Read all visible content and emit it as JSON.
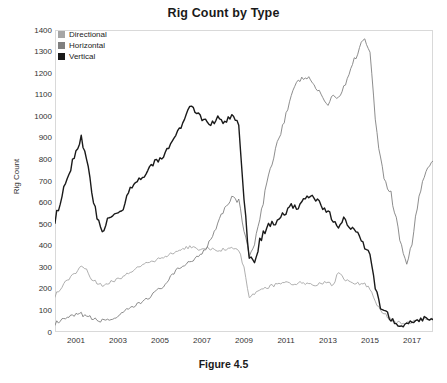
{
  "figure": {
    "title": "Rig Count by Type",
    "caption": "Figure 4.5"
  },
  "legend": {
    "position": "top-left-inside",
    "items": [
      {
        "label": "Directional",
        "color": "#a6a6a6",
        "swatch_name": "legend-swatch-directional"
      },
      {
        "label": "Horizontal",
        "color": "#808080",
        "swatch_name": "legend-swatch-horizontal"
      },
      {
        "label": "Vertical",
        "color": "#1a1a1a",
        "swatch_name": "legend-swatch-vertical"
      }
    ]
  },
  "axes": {
    "y_title": "Rig Count",
    "y_ticks": [
      "0",
      "100",
      "200",
      "300",
      "400",
      "500",
      "600",
      "700",
      "800",
      "900",
      "1000",
      "1100",
      "1200",
      "1300",
      "1400"
    ],
    "x_ticks": [
      "2001",
      "2003",
      "2005",
      "2007",
      "2009",
      "2011",
      "2013",
      "2015",
      "2017"
    ]
  },
  "chart_data": {
    "type": "line",
    "title": "Rig Count by Type",
    "subtitle": "Figure 4.5",
    "xlabel": "",
    "ylabel": "Rig Count",
    "xlim": [
      2000.0,
      2018.0
    ],
    "ylim": [
      0,
      1400
    ],
    "y_ticks": [
      0,
      100,
      200,
      300,
      400,
      500,
      600,
      700,
      800,
      900,
      1000,
      1100,
      1200,
      1300,
      1400
    ],
    "x_ticks": [
      2001,
      2003,
      2005,
      2007,
      2009,
      2011,
      2013,
      2015,
      2017
    ],
    "grid": false,
    "legend_position": "upper left",
    "x_unit": "year (quarterly samples)",
    "x": [
      2000.0,
      2000.25,
      2000.5,
      2000.75,
      2001.0,
      2001.25,
      2001.5,
      2001.75,
      2002.0,
      2002.25,
      2002.5,
      2002.75,
      2003.0,
      2003.25,
      2003.5,
      2003.75,
      2004.0,
      2004.25,
      2004.5,
      2004.75,
      2005.0,
      2005.25,
      2005.5,
      2005.75,
      2006.0,
      2006.25,
      2006.5,
      2006.75,
      2007.0,
      2007.25,
      2007.5,
      2007.75,
      2008.0,
      2008.25,
      2008.5,
      2008.75,
      2009.0,
      2009.25,
      2009.5,
      2009.75,
      2010.0,
      2010.25,
      2010.5,
      2010.75,
      2011.0,
      2011.25,
      2011.5,
      2011.75,
      2012.0,
      2012.25,
      2012.5,
      2012.75,
      2013.0,
      2013.25,
      2013.5,
      2013.75,
      2014.0,
      2014.25,
      2014.5,
      2014.75,
      2015.0,
      2015.25,
      2015.5,
      2015.75,
      2016.0,
      2016.25,
      2016.5,
      2016.75,
      2017.0,
      2017.25,
      2017.5,
      2017.75,
      2018.0
    ],
    "series": [
      {
        "name": "Vertical",
        "color": "#1a1a1a",
        "values": [
          520,
          600,
          690,
          760,
          840,
          900,
          820,
          640,
          530,
          450,
          520,
          545,
          555,
          570,
          640,
          690,
          710,
          730,
          760,
          790,
          800,
          830,
          870,
          900,
          960,
          1010,
          1050,
          1015,
          990,
          975,
          965,
          990,
          975,
          985,
          1010,
          960,
          610,
          345,
          330,
          420,
          470,
          500,
          510,
          540,
          555,
          585,
          575,
          600,
          625,
          630,
          610,
          580,
          560,
          510,
          490,
          520,
          490,
          470,
          440,
          395,
          380,
          220,
          120,
          95,
          60,
          35,
          30,
          40,
          50,
          58,
          62,
          60,
          62
        ],
        "peak": 1050,
        "min": 28
      },
      {
        "name": "Horizontal",
        "color": "#808080",
        "values": [
          40,
          48,
          60,
          70,
          78,
          82,
          75,
          62,
          55,
          52,
          58,
          62,
          70,
          85,
          105,
          118,
          130,
          148,
          165,
          180,
          200,
          225,
          250,
          280,
          300,
          320,
          330,
          345,
          370,
          400,
          450,
          510,
          560,
          600,
          630,
          600,
          480,
          355,
          400,
          520,
          640,
          760,
          850,
          930,
          1010,
          1090,
          1150,
          1175,
          1180,
          1160,
          1120,
          1090,
          1050,
          1095,
          1090,
          1130,
          1200,
          1260,
          1320,
          1370,
          1290,
          1000,
          800,
          690,
          640,
          520,
          400,
          305,
          420,
          580,
          700,
          760,
          790
        ],
        "peak": 1370,
        "min": 300
      },
      {
        "name": "Directional",
        "color": "#a6a6a6",
        "values": [
          170,
          200,
          230,
          255,
          280,
          310,
          290,
          245,
          225,
          215,
          228,
          235,
          245,
          260,
          275,
          290,
          300,
          312,
          325,
          330,
          340,
          350,
          362,
          372,
          380,
          390,
          395,
          385,
          380,
          390,
          385,
          378,
          382,
          390,
          392,
          380,
          300,
          160,
          175,
          195,
          205,
          212,
          218,
          222,
          226,
          222,
          226,
          228,
          225,
          222,
          218,
          228,
          232,
          215,
          275,
          245,
          232,
          228,
          225,
          225,
          200,
          140,
          100,
          78,
          60,
          45,
          38,
          40,
          48,
          54,
          58,
          60,
          60
        ],
        "peak": 400,
        "min": 35
      }
    ]
  }
}
